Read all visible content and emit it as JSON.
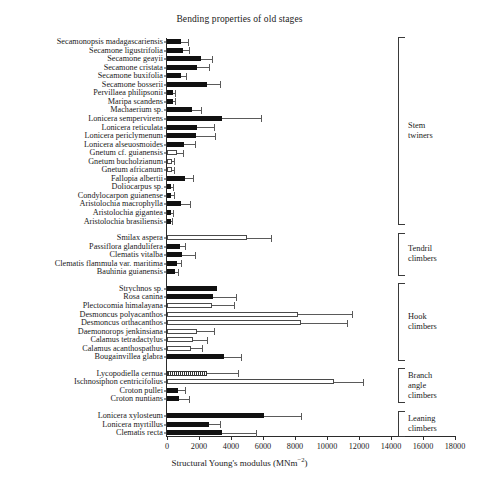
{
  "chart_data": {
    "type": "bar",
    "orientation": "horizontal",
    "title": "Bending properties of old stages",
    "xlabel": "Structural Young's modulus (MNm⁻²)",
    "ylabel": "",
    "xlim": [
      0,
      18000
    ],
    "xticks": [
      0,
      2000,
      4000,
      6000,
      8000,
      10000,
      12000,
      14000,
      16000,
      18000
    ],
    "xticklabels": [
      "0",
      "2000",
      "4000",
      "6000",
      "8000",
      "10000",
      "12000",
      "14000",
      "16000",
      "18000"
    ],
    "grid": false,
    "legend": "none",
    "error_bars": "standard deviation (upper only)",
    "fill_legend": {
      "solid": "filled black bar",
      "hollow": "open white bar",
      "hatch": "hatched bar"
    },
    "categories": [
      "Secamonopsis madagascariensis",
      "Secamone ligustrifolia",
      "Secamone geayii",
      "Secamone cristata",
      "Secamone buxifolia",
      "Secamone bosserii",
      "Pervillaea philipsonii",
      "Maripa scandens",
      "Machaerium sp.",
      "Lonicera sempervirens",
      "Lonicera reticulata",
      "Lonicera periclymenum",
      "Lonicera alseuosmoides",
      "Gnetum cf. guianensis",
      "Gnetum bucholzianum",
      "Gnetum africanum",
      "Fallopia albertii",
      "Doliocarpus sp.",
      "Condylocarpon guianense",
      "Aristolochia macrophylla",
      "Aristolochia gigantea",
      "Aristolochia brasiliensis",
      "Smilax aspera",
      "Passiflora glandulifera",
      "Clematis vitalba",
      "Clematis flammula var. maritima",
      "Bauhinia guianensis",
      "Strychnos sp.",
      "Rosa canina",
      "Plectocomia himalayana",
      "Desmoncus polyacanthos",
      "Desmoncus orthacanthos",
      "Daemonorops jenkinsiana",
      "Calamus tetradactylus",
      "Calamus acanthospathus",
      "Bougainvillea glabra",
      "Lycopodiella cernua",
      "Ischnosiphon centricifolius",
      "Croton pullei",
      "Croton nuntians",
      "Lonicera xylosteum",
      "Lonicera myrtillus",
      "Clematis recta"
    ],
    "values": [
      850,
      1000,
      2100,
      1900,
      900,
      2500,
      350,
      380,
      1550,
      3450,
      1850,
      1800,
      1050,
      600,
      320,
      300,
      1150,
      280,
      280,
      850,
      270,
      220,
      5000,
      800,
      950,
      620,
      480,
      3100,
      2900,
      2800,
      8200,
      8350,
      1850,
      1600,
      1500,
      3550,
      2500,
      10450,
      700,
      780,
      6050,
      2600,
      3450
    ],
    "errors": [
      450,
      400,
      700,
      750,
      300,
      800,
      120,
      150,
      600,
      2400,
      1100,
      1200,
      700,
      400,
      130,
      130,
      500,
      120,
      130,
      600,
      110,
      90,
      1500,
      300,
      800,
      250,
      200,
      0,
      1400,
      1400,
      3350,
      2900,
      1100,
      900,
      700,
      1100,
      1950,
      1800,
      400,
      600,
      2300,
      700,
      2100
    ],
    "fills": [
      "solid",
      "solid",
      "solid",
      "solid",
      "solid",
      "solid",
      "solid",
      "solid",
      "solid",
      "solid",
      "solid",
      "solid",
      "solid",
      "hollow",
      "hollow",
      "hollow",
      "solid",
      "solid",
      "solid",
      "solid",
      "solid",
      "solid",
      "hollow",
      "solid",
      "solid",
      "solid",
      "solid",
      "solid",
      "solid",
      "hollow",
      "hollow",
      "hollow",
      "hollow",
      "hollow",
      "hollow",
      "solid",
      "hatch",
      "hollow",
      "solid",
      "solid",
      "solid",
      "solid",
      "solid"
    ]
  },
  "groups": [
    {
      "label": "Stem\ntwiners",
      "from": 0,
      "to": 21
    },
    {
      "label": "Tendril\nclimbers",
      "from": 22,
      "to": 26
    },
    {
      "label": "Hook\nclimbers",
      "from": 27,
      "to": 35
    },
    {
      "label": "Branch angle\nclimbers",
      "from": 36,
      "to": 39
    },
    {
      "label": "Leaning\nclimbers",
      "from": 40,
      "to": 42
    }
  ],
  "gaps_after": [
    21,
    26,
    35,
    39
  ],
  "colors": {
    "bar_solid": "#111111",
    "bar_hollow_fill": "#ffffff",
    "bar_outline": "#4a4a4a",
    "axis": "#2b2b2b",
    "error": "#5a5a5a",
    "text": "#1a1a1a",
    "background": "#ffffff"
  }
}
